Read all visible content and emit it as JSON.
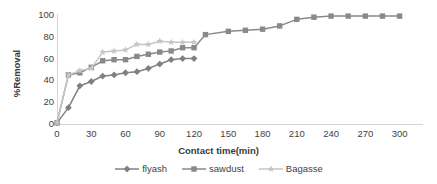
{
  "chart_data": {
    "type": "line",
    "title": "",
    "xlabel": "Contact time(min)",
    "ylabel": "%Removal",
    "xlim": [
      0,
      310
    ],
    "ylim": [
      0,
      100
    ],
    "grid": false,
    "legend_position": "bottom",
    "xticks": [
      "0",
      "30",
      "60",
      "90",
      "120",
      "150",
      "180",
      "210",
      "240",
      "270",
      "300"
    ],
    "xtick_values": [
      0,
      30,
      60,
      90,
      120,
      150,
      180,
      210,
      240,
      270,
      300
    ],
    "yticks": [
      "0",
      "20",
      "40",
      "60",
      "80",
      "100"
    ],
    "ytick_values": [
      0,
      20,
      40,
      60,
      80,
      100
    ],
    "series": [
      {
        "name": "flyash",
        "marker": "diamond",
        "color": "#808080",
        "x": [
          0,
          10,
          20,
          30,
          40,
          50,
          60,
          70,
          80,
          90,
          100,
          110,
          120
        ],
        "values": [
          1,
          15,
          35,
          39,
          44,
          45,
          47,
          48,
          51,
          55,
          59,
          60,
          60
        ]
      },
      {
        "name": "sawdust",
        "marker": "square",
        "color": "#898989",
        "x": [
          0,
          10,
          20,
          30,
          40,
          50,
          60,
          70,
          80,
          90,
          100,
          110,
          120,
          130,
          150,
          165,
          180,
          195,
          210,
          225,
          240,
          255,
          270,
          285,
          300
        ],
        "values": [
          1,
          45,
          47,
          52,
          58,
          59,
          59,
          62,
          64,
          66,
          67,
          70,
          70,
          82,
          85,
          86,
          87,
          90,
          96,
          98,
          99,
          99,
          99,
          99,
          99
        ]
      },
      {
        "name": "Bagasse",
        "marker": "star",
        "color": "#c6c6c6",
        "x": [
          0,
          10,
          20,
          30,
          40,
          50,
          60,
          70,
          80,
          90,
          100,
          110,
          120
        ],
        "values": [
          1,
          45,
          49,
          51,
          66,
          67,
          68,
          73,
          73,
          76,
          75,
          75,
          75
        ]
      }
    ]
  }
}
